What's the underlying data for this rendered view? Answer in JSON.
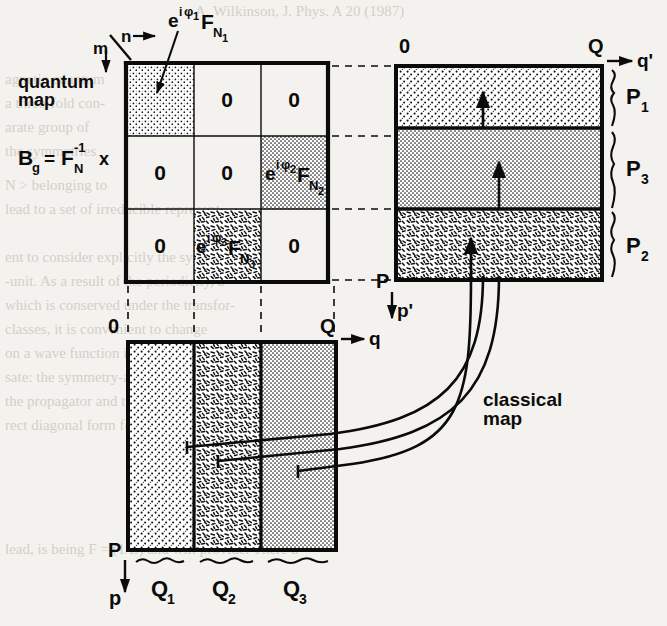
{
  "figure": {
    "title_quantum": "quantum",
    "title_map": "map",
    "formula": {
      "b": "B",
      "b_sub": "g",
      "eq": "=",
      "f": "F",
      "f_sub": "N",
      "f_sup": "-1",
      "times": "x"
    },
    "axes": {
      "n": "n",
      "m": "m",
      "zero_matrix_top": "0",
      "right_zero": "0",
      "right_Q": "Q",
      "right_qprime": "q'",
      "right_P": "P",
      "right_pprime": "p'",
      "bottom_zero": "0",
      "bottom_Q": "Q",
      "bottom_q": "q",
      "bottom_P": "P",
      "bottom_p": "p"
    },
    "matrix": {
      "rows": [
        [
          "e^{iφ1} F_{N1}",
          "0",
          "0"
        ],
        [
          "0",
          "0",
          "e^{iφ2} F_{N2}"
        ],
        [
          "0",
          "e^{iφ3} F_{N3}",
          "0"
        ]
      ],
      "zero_label": "0",
      "cell_labels": [
        {
          "e": "e",
          "sup_i": "i",
          "sup_phi": "φ",
          "sup_idx": "1",
          "F": "F",
          "sub": "N",
          "sub_idx": "1"
        },
        {
          "e": "e",
          "sup_i": "i",
          "sup_phi": "φ",
          "sup_idx": "2",
          "F": "F",
          "sub": "N",
          "sub_idx": "2"
        },
        {
          "e": "e",
          "sup_i": "i",
          "sup_phi": "φ",
          "sup_idx": "3",
          "F": "F",
          "sub": "N",
          "sub_idx": "3"
        }
      ]
    },
    "right_panel": {
      "bands": [
        {
          "name": "P1",
          "base": "P",
          "idx": "1",
          "fill": "dots-coarse"
        },
        {
          "name": "P3",
          "base": "P",
          "idx": "3",
          "fill": "dots-fine"
        },
        {
          "name": "P2",
          "base": "P",
          "idx": "2",
          "fill": "dashes"
        }
      ]
    },
    "bottom_panel": {
      "columns": [
        {
          "name": "Q1",
          "base": "Q",
          "idx": "1",
          "fill": "dots-coarse"
        },
        {
          "name": "Q2",
          "base": "Q",
          "idx": "2",
          "fill": "dashes"
        },
        {
          "name": "Q3",
          "base": "Q",
          "idx": "3",
          "fill": "dots-fine"
        }
      ]
    },
    "classical_map": {
      "line1": "classical",
      "line2": "map"
    },
    "background_text": {
      "top": "A. Wilkinson, J. Phys. A 20 (1987)",
      "l1": "agnetic quantum",
      "l2": "a three-fold con-",
      "l3": "arate group of",
      "l4": "the symmetries",
      "l5": "N  >  belonging to",
      "l6": "lead to a set of irreducible represent-",
      "l7": "ent to consider explicitly the symmetry",
      "l8": "-unit. As a result of the periodicity, a",
      "l9": "which is conserved under the transfor-",
      "l10": "classes, it is convenient to change",
      "l11": "on a wave function is then to multiply",
      "l12": "sate: the symmetry-adapted form, a way",
      "l13": "the propagator and transforming to a",
      "l14": "rect diagonal form for the evolution",
      "l15": "lead, is being F = (1/L)   and will provide. There a"
    },
    "colors": {
      "ink": "#0b0b0b",
      "paper": "#f4f2ee",
      "ghost": "#b9b3a8"
    }
  }
}
